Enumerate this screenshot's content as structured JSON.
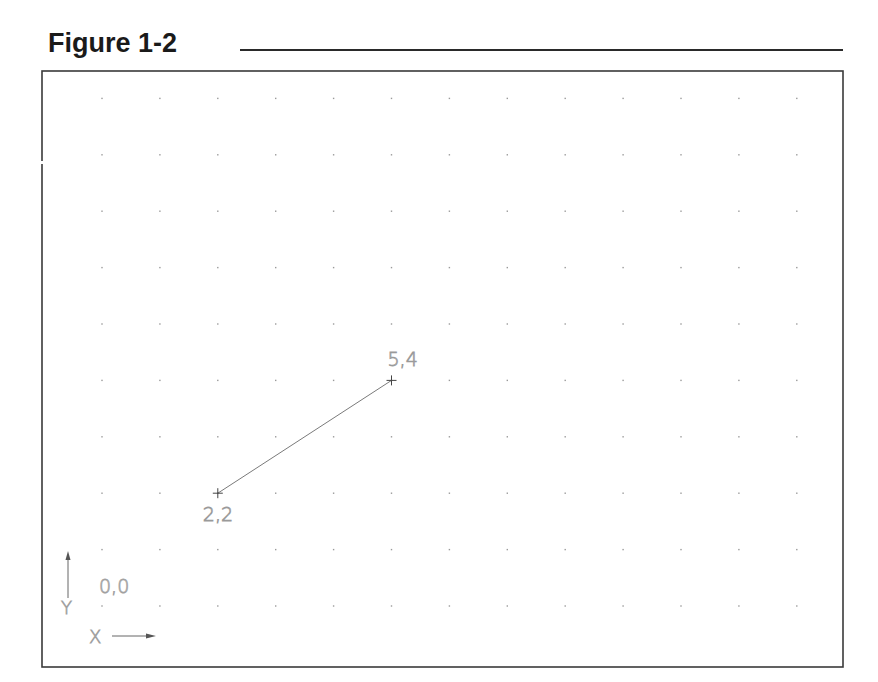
{
  "figure": {
    "title": "Figure 1-2"
  },
  "drawing": {
    "frame": {
      "x1": 42,
      "y1": 71,
      "x2": 843,
      "y2": 667,
      "color": "#3a3a3a"
    },
    "grid": {
      "origin_px": {
        "x": 102,
        "y": 606
      },
      "spacing_px": {
        "x": 57.9,
        "y": 56.4
      },
      "columns": 13,
      "rows": 10,
      "dot_color": "#9a9a9a"
    },
    "line": {
      "from": {
        "x": 2,
        "y": 2
      },
      "to": {
        "x": 5,
        "y": 4
      },
      "color": "#7a7a7a"
    },
    "point_labels": [
      {
        "text": "2,2",
        "x": 2,
        "y": 2,
        "dx": -15,
        "dy": 28
      },
      {
        "text": "5,4",
        "x": 5,
        "y": 4,
        "dx": -4,
        "dy": -14
      }
    ],
    "origin_label": "0,0",
    "ucs_icon": {
      "x_label": "X",
      "y_label": "Y"
    },
    "text_color": "#9a9a9a"
  }
}
